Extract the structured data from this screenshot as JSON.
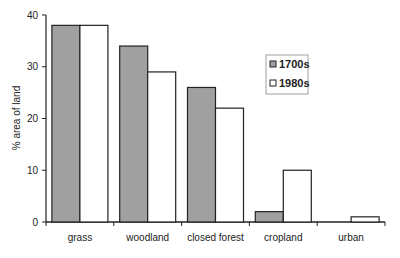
{
  "chart_data": {
    "type": "bar",
    "title": "",
    "xlabel": "",
    "ylabel": "% area of land",
    "ylim": [
      0,
      40
    ],
    "yticks": [
      0,
      10,
      20,
      30,
      40
    ],
    "grid": false,
    "legend_position": "inside-top-right",
    "categories": [
      "grass",
      "woodland",
      "closed forest",
      "cropland",
      "urban"
    ],
    "series": [
      {
        "name": "1700s",
        "color": "#a0a0a0",
        "values": [
          38,
          34,
          26,
          2,
          0
        ]
      },
      {
        "name": "1980s",
        "color": "#ffffff",
        "values": [
          38,
          29,
          22,
          10,
          1
        ]
      }
    ]
  }
}
